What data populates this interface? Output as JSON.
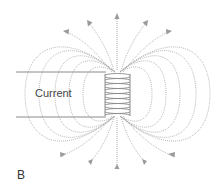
{
  "figure": {
    "panel_label": "B",
    "current_label": "Current",
    "colors": {
      "field_lines": "#a8a8a8",
      "wire": "#8a8a8a",
      "text": "#444444"
    },
    "coil": {
      "turns": 15
    },
    "field_line_arrows": {
      "top": 5,
      "bottom": 5,
      "direction": "outward"
    }
  }
}
